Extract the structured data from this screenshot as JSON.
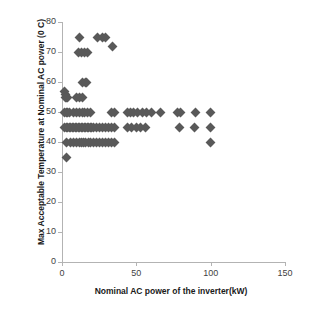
{
  "chart_data": {
    "type": "scatter",
    "title": "",
    "xlabel": "Nominal AC power of the inverter(kW)",
    "ylabel": "Max Acceptable Temperature at Nominal AC power (0 C)",
    "xlim": [
      0,
      150
    ],
    "ylim": [
      0,
      80
    ],
    "xticks": [
      0,
      50,
      100,
      150
    ],
    "yticks": [
      0,
      10,
      20,
      30,
      40,
      50,
      60,
      70,
      80
    ],
    "xtick_labels": [
      "0",
      "50",
      "100",
      "150"
    ],
    "ytick_labels": [
      "0",
      "10",
      "20",
      "30",
      "40",
      "50",
      "60",
      "70",
      "80"
    ],
    "grid": false,
    "legend": null,
    "marker": "diamond",
    "marker_color": "#595959",
    "series": [
      {
        "name": "Inverters",
        "points": [
          [
            2.0,
            57
          ],
          [
            2.5,
            56
          ],
          [
            3.0,
            55
          ],
          [
            3.5,
            55
          ],
          [
            2.2,
            55
          ],
          [
            10.0,
            55
          ],
          [
            12.0,
            55
          ],
          [
            14.0,
            55
          ],
          [
            14.0,
            60
          ],
          [
            15.5,
            60
          ],
          [
            16.5,
            60
          ],
          [
            12.0,
            75
          ],
          [
            24.0,
            75
          ],
          [
            27.0,
            75
          ],
          [
            29.0,
            75
          ],
          [
            11.0,
            70
          ],
          [
            13.0,
            70
          ],
          [
            15.0,
            70
          ],
          [
            17.0,
            70
          ],
          [
            34.0,
            72
          ],
          [
            2.0,
            50
          ],
          [
            3.0,
            50
          ],
          [
            4.0,
            50
          ],
          [
            5.0,
            50
          ],
          [
            8.0,
            50
          ],
          [
            10.0,
            50
          ],
          [
            12.0,
            50
          ],
          [
            13.5,
            50
          ],
          [
            15.0,
            50
          ],
          [
            17.0,
            50
          ],
          [
            19.0,
            50
          ],
          [
            33.0,
            50
          ],
          [
            35.0,
            50
          ],
          [
            44.0,
            50
          ],
          [
            46.0,
            50
          ],
          [
            48.0,
            50
          ],
          [
            51.0,
            50
          ],
          [
            54.0,
            50
          ],
          [
            57.0,
            50
          ],
          [
            60.0,
            50
          ],
          [
            66.0,
            50
          ],
          [
            78.0,
            50
          ],
          [
            80.0,
            50
          ],
          [
            90.0,
            50
          ],
          [
            100.0,
            50
          ],
          [
            2.0,
            45
          ],
          [
            3.0,
            45
          ],
          [
            4.0,
            45
          ],
          [
            5.0,
            45
          ],
          [
            6.0,
            45
          ],
          [
            7.0,
            45
          ],
          [
            8.0,
            45
          ],
          [
            9.0,
            45
          ],
          [
            10.0,
            45
          ],
          [
            11.0,
            45
          ],
          [
            12.0,
            45
          ],
          [
            13.0,
            45
          ],
          [
            14.0,
            45
          ],
          [
            15.0,
            45
          ],
          [
            16.0,
            45
          ],
          [
            17.0,
            45
          ],
          [
            18.0,
            45
          ],
          [
            19.0,
            45
          ],
          [
            20.0,
            45
          ],
          [
            21.0,
            45
          ],
          [
            23.0,
            45
          ],
          [
            25.0,
            45
          ],
          [
            27.0,
            45
          ],
          [
            29.0,
            45
          ],
          [
            31.0,
            45
          ],
          [
            33.0,
            45
          ],
          [
            35.0,
            45
          ],
          [
            44.0,
            45
          ],
          [
            47.0,
            45
          ],
          [
            50.0,
            45
          ],
          [
            53.0,
            45
          ],
          [
            56.0,
            45
          ],
          [
            79.0,
            45
          ],
          [
            89.0,
            45
          ],
          [
            100.0,
            45
          ],
          [
            3.0,
            40
          ],
          [
            6.0,
            40
          ],
          [
            8.0,
            40
          ],
          [
            10.0,
            40
          ],
          [
            11.5,
            40
          ],
          [
            13.0,
            40
          ],
          [
            14.5,
            40
          ],
          [
            16.0,
            40
          ],
          [
            17.5,
            40
          ],
          [
            19.0,
            40
          ],
          [
            21.0,
            40
          ],
          [
            23.0,
            40
          ],
          [
            25.0,
            40
          ],
          [
            27.0,
            40
          ],
          [
            29.0,
            40
          ],
          [
            31.0,
            40
          ],
          [
            33.0,
            40
          ],
          [
            35.0,
            40
          ],
          [
            100.0,
            40
          ],
          [
            3.0,
            35
          ]
        ]
      }
    ]
  }
}
